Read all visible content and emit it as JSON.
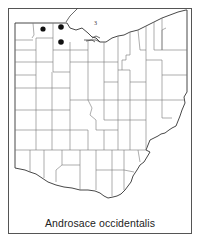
{
  "map": {
    "region": "Ohio",
    "division": "counties",
    "species_label": "Androsace occidentalis",
    "lake_marker": "3",
    "record_count": 3,
    "records": [
      {
        "x": 43,
        "y": 29,
        "area": "northwest Ohio (Fulton Co.)"
      },
      {
        "x": 61,
        "y": 27,
        "area": "northwest Ohio (Lucas Co.)"
      },
      {
        "x": 61,
        "y": 42,
        "area": "northwest Ohio (Wood Co.)"
      }
    ],
    "colors": {
      "dot": "#111111",
      "outline": "#333333",
      "county_lines": "#777777",
      "background": "#ffffff"
    }
  }
}
